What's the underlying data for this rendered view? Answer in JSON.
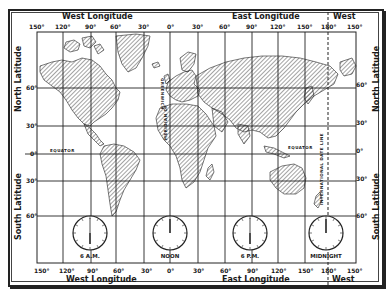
{
  "map": {
    "title_top_west": "West Longitude",
    "title_top_east": "East Longitude",
    "title_top_west_right": "West",
    "title_bottom_west": "West Longitude",
    "title_bottom_east": "East Longitude",
    "title_bottom_west_right": "West",
    "left_north": "North Latitude",
    "left_south": "South Latitude",
    "right_north": "North Latitude",
    "right_south": "South Latitude",
    "longitudes": [
      "150°",
      "120°",
      "90°",
      "60°",
      "30°",
      "0°",
      "30°",
      "60°",
      "90°",
      "120°",
      "150°",
      "180°",
      "150°"
    ],
    "latitudes_left": [
      "60°",
      "30°",
      "0°",
      "30°",
      "60°"
    ],
    "latitudes_right": [
      "60°",
      "30°",
      "0°",
      "30°",
      "60°"
    ],
    "equator_label": "EQUATOR",
    "equator_label_east": "EQUATOR",
    "greenwich_label": "GREENWICH",
    "meridian_label": "MERIDIAN OF",
    "date_line_label": "INTERNATIONAL DATE LINE",
    "clocks": [
      {
        "label": "6 A.M.",
        "hour": 6
      },
      {
        "label": "NOON",
        "hour": 12
      },
      {
        "label": "6 P.M.",
        "hour": 18
      },
      {
        "label": "MIDNIGHT",
        "hour": 24
      }
    ],
    "clock_numerals": [
      "12",
      "1",
      "2",
      "3",
      "4",
      "5",
      "6",
      "7",
      "8",
      "9",
      "10",
      "11"
    ],
    "colors": {
      "ink": "#1a1a1a",
      "paper": "#ffffff",
      "hatch": "#333333"
    }
  }
}
